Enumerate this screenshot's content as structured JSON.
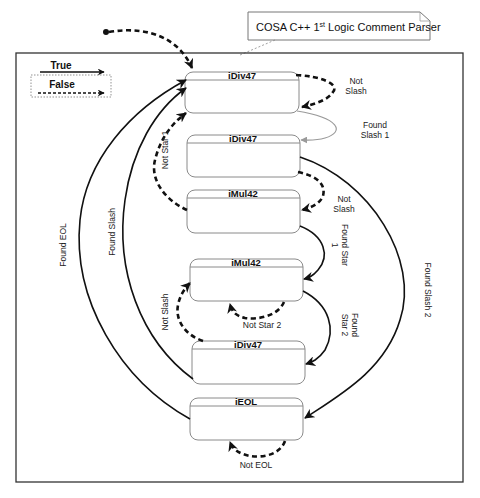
{
  "title": {
    "main": "COSA C++ 1",
    "superscript": "st",
    "rest": " Logic Comment Parser"
  },
  "legend": {
    "true_label": "True",
    "false_label": "False"
  },
  "states": [
    {
      "id": "s1",
      "label": "iDiv47"
    },
    {
      "id": "s2",
      "label": "iDiv47"
    },
    {
      "id": "s3",
      "label": "iMul42"
    },
    {
      "id": "s4",
      "label": "iMul42"
    },
    {
      "id": "s5",
      "label": "iDiv47"
    },
    {
      "id": "s6",
      "label": "iEOL"
    }
  ],
  "transitions": {
    "not_slash_1": {
      "line1": "Not",
      "line2": "Slash",
      "type": "false"
    },
    "found_slash_1": {
      "line1": "Found",
      "line2": "Slash 1",
      "type": "true"
    },
    "not_star_1": {
      "label": "Not Star 1",
      "type": "false"
    },
    "not_slash_2": {
      "line1": "Not",
      "line2": "Slash",
      "type": "false"
    },
    "found_star_1": {
      "line1": "Found Star",
      "line2": "1",
      "type": "true"
    },
    "found_slash_2": {
      "label": "Found Slash 2",
      "type": "true"
    },
    "not_star_2": {
      "label": "Not Star 2",
      "type": "false"
    },
    "found_star_2": {
      "line1": "Found",
      "line2": "Star 2",
      "type": "true"
    },
    "not_slash_3": {
      "label": "Not Slash",
      "type": "false"
    },
    "found_slash": {
      "label": "Found Slash",
      "type": "true"
    },
    "found_eol": {
      "label": "Found EOL",
      "type": "true"
    },
    "not_eol": {
      "label": "Not EOL",
      "type": "false"
    }
  }
}
